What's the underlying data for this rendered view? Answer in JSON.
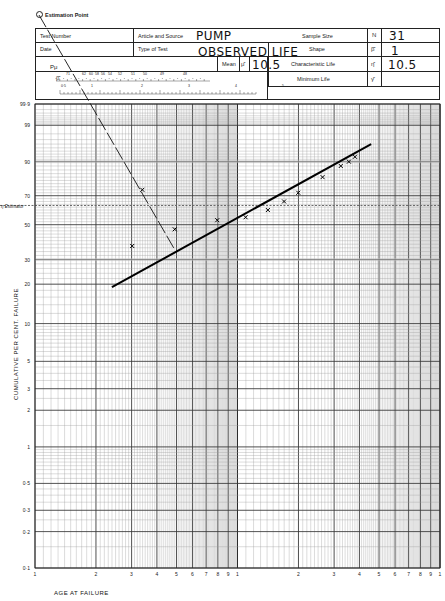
{
  "form": {
    "estimation_point_label": "Estimation Point",
    "test_number_label": "Test Number",
    "test_number_value": "",
    "date_label": "Date",
    "date_value": "",
    "article_label": "Article and Source",
    "article_value": "PUMP",
    "type_label": "Type of Test",
    "type_value": "OBSERVED LIFE",
    "sample_size_label": "Sample Size",
    "sample_size_symbol": "N",
    "sample_size_value": "31",
    "shape_label": "Shape",
    "shape_symbol": "β̂",
    "shape_value": "1",
    "mean_label": "Mean",
    "mean_symbol": "μ̂",
    "mean_value": "10.5",
    "char_life_label": "Characteristic Life",
    "char_life_symbol": "η̂",
    "char_life_value": "10.5",
    "min_life_label": "Minimum Life",
    "min_life_symbol": "γ̂",
    "min_life_value": "",
    "pmu_scale_label": "Pμ",
    "pmu_ticks": [
      "71",
      "62",
      "60",
      "58",
      "56",
      "54",
      "52",
      "51",
      "50",
      "49",
      "48"
    ],
    "beta_scale_label": "β̂",
    "beta_ticks": [
      "0.5",
      "1",
      "2",
      "3",
      "4",
      "5"
    ]
  },
  "chart_data": {
    "type": "scatter",
    "xlabel": "AGE AT FAILURE",
    "ylabel": "CUMULATIVE PER CENT. FAILURE",
    "x_scale": "log",
    "y_scale": "weibull",
    "x_tick_labels": [
      "1",
      "2",
      "3",
      "4",
      "5",
      "6",
      "7",
      "8",
      "9",
      "1",
      "2",
      "3",
      "4",
      "5",
      "6",
      "7",
      "8",
      "9",
      "1"
    ],
    "y_tick_labels": [
      "99.9",
      "99",
      "90",
      "70",
      "50",
      "30",
      "20",
      "10",
      "5",
      "3",
      "2",
      "1",
      "0.5",
      "0.3",
      "0.2",
      "0.1"
    ],
    "estimator_line_label": "η Estimator",
    "estimator_percent": 63.2,
    "grid": true,
    "points": [
      {
        "x_decade_pos": 0.48,
        "y_pct": 37
      },
      {
        "x_decade_pos": 0.53,
        "y_pct": 74
      },
      {
        "x_decade_pos": 0.69,
        "y_pct": 47
      },
      {
        "x_decade_pos": 0.9,
        "y_pct": 53
      },
      {
        "x_decade_pos": 1.04,
        "y_pct": 55
      },
      {
        "x_decade_pos": 1.15,
        "y_pct": 60
      },
      {
        "x_decade_pos": 1.23,
        "y_pct": 66
      },
      {
        "x_decade_pos": 1.3,
        "y_pct": 72
      },
      {
        "x_decade_pos": 1.42,
        "y_pct": 82
      },
      {
        "x_decade_pos": 1.51,
        "y_pct": 88
      },
      {
        "x_decade_pos": 1.58,
        "y_pct": 92
      },
      {
        "x_decade_pos": 1.55,
        "y_pct": 90
      }
    ],
    "fit_line": {
      "from": {
        "x_decade_pos": 0.38,
        "y_pct": 19
      },
      "to": {
        "x_decade_pos": 1.66,
        "y_pct": 96
      }
    },
    "estimation_line": {
      "from": "estimation_point",
      "to": {
        "x_decade_pos": 0.69,
        "y_pct": 35
      }
    }
  }
}
